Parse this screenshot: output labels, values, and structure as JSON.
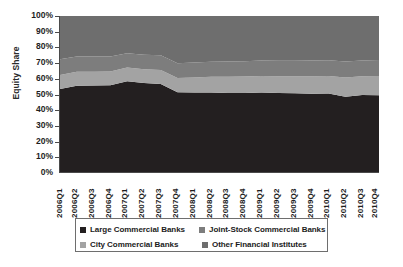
{
  "chart_data": {
    "type": "area",
    "stacked": true,
    "normalized": true,
    "title": "",
    "subtitle": "",
    "xlabel": "",
    "ylabel": "Equity Share",
    "ylim": [
      0,
      100
    ],
    "ytick_labels": [
      "100%",
      "90%",
      "80%",
      "70%",
      "60%",
      "50%",
      "40%",
      "30%",
      "20%",
      "10%",
      "0%"
    ],
    "ytick_values": [
      100,
      90,
      80,
      70,
      60,
      50,
      40,
      30,
      20,
      10,
      0
    ],
    "grid": false,
    "legend_position": "bottom",
    "categories": [
      "2006Q1",
      "2006Q2",
      "2006Q3",
      "2006Q4",
      "2007Q1",
      "2007Q2",
      "2007Q3",
      "2007Q4",
      "2008Q1",
      "2008Q2",
      "2008Q3",
      "2008Q4",
      "2009Q1",
      "2009Q2",
      "2009Q3",
      "2009Q4",
      "2010Q1",
      "2010Q2",
      "2010Q3",
      "2010Q4"
    ],
    "series": [
      {
        "name": "Large Commercial Banks",
        "color": "#231f20",
        "values": [
          53.2,
          55.3,
          55.5,
          55.6,
          58.2,
          57.0,
          56.4,
          51.2,
          51.0,
          51.0,
          50.7,
          50.6,
          51.0,
          50.6,
          50.4,
          50.2,
          50.3,
          48.2,
          49.3,
          49.2
        ]
      },
      {
        "name": "City Commercial Banks",
        "color": "#a3a3a3",
        "values": [
          9.0,
          8.9,
          8.8,
          8.8,
          8.8,
          8.9,
          9.0,
          9.0,
          9.6,
          10.0,
          10.4,
          10.6,
          10.6,
          10.8,
          11.0,
          11.2,
          11.3,
          12.4,
          12.0,
          12.3
        ]
      },
      {
        "name": "Joint-Stock Commercial Banks",
        "color": "#7d7d7d",
        "values": [
          10.0,
          9.8,
          9.7,
          9.6,
          9.2,
          9.3,
          9.4,
          9.5,
          9.6,
          9.7,
          9.8,
          9.8,
          9.8,
          9.9,
          9.9,
          10.0,
          10.0,
          10.2,
          10.2,
          10.3
        ]
      },
      {
        "name": "Other Financial Institutes",
        "color": "#6e6e6e",
        "values": [
          27.8,
          26.0,
          26.0,
          26.0,
          23.8,
          24.8,
          25.2,
          30.3,
          29.8,
          29.3,
          29.1,
          29.0,
          28.6,
          28.7,
          28.7,
          28.6,
          28.4,
          29.2,
          28.5,
          28.2
        ]
      }
    ]
  },
  "legend": {
    "entries": [
      {
        "label": "Large Commercial Banks",
        "color": "#231f20"
      },
      {
        "label": "Joint-Stock Commercial Banks",
        "color": "#7d7d7d"
      },
      {
        "label": "City Commercial Banks",
        "color": "#a3a3a3"
      },
      {
        "label": "Other Financial Institutes",
        "color": "#6e6e6e"
      }
    ]
  }
}
